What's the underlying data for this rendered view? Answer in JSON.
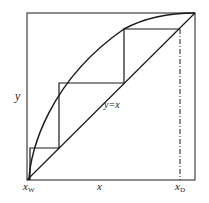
{
  "diagram": {
    "type": "mccabe-thiele",
    "axis_labels": {
      "y": "y",
      "x": "x",
      "x_start": "x",
      "x_start_sub": "W",
      "x_end": "x",
      "x_end_sub": "D"
    },
    "diagonal_label": "y=x",
    "frame": {
      "left": 27,
      "top": 13,
      "right": 195,
      "bottom": 180
    },
    "steps": [
      {
        "x_from": 180,
        "y": 29,
        "x_to": 124
      },
      {
        "x_from": 124,
        "y": 83,
        "x_to": 59
      },
      {
        "x_from": 59,
        "y": 148,
        "x_to": 30
      }
    ],
    "colors": {
      "line": "#1a1a1a",
      "background": "#ffffff"
    }
  }
}
